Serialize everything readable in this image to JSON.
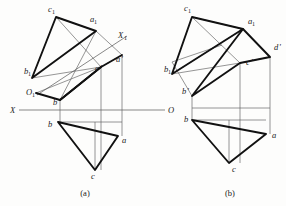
{
  "figure": {
    "captions": [
      {
        "id": "caption-a",
        "text": "(a)"
      },
      {
        "id": "caption-b",
        "text": "(b)"
      }
    ],
    "axes": [
      {
        "name": "X",
        "label": "X"
      },
      {
        "name": "O",
        "label": "O"
      },
      {
        "name": "X1",
        "label": "X",
        "subscript": "1"
      },
      {
        "name": "O1",
        "label": "O",
        "subscript": "1"
      }
    ]
  },
  "diagram_a": {
    "caption": "(a)",
    "labels": [
      {
        "key": "c1",
        "text": "c",
        "subscript": "1",
        "prime": "",
        "x": 48,
        "y": 12
      },
      {
        "key": "a1",
        "text": "a",
        "subscript": "1",
        "prime": "",
        "x": 90,
        "y": 22
      },
      {
        "key": "x1_axis",
        "text": "X",
        "subscript": "1",
        "prime": "",
        "x": 118,
        "y": 38
      },
      {
        "key": "b1",
        "text": "b",
        "subscript": "1",
        "prime": "",
        "x": 24,
        "y": 74
      },
      {
        "key": "o1_axis",
        "text": "O",
        "subscript": "1",
        "prime": "",
        "x": 26,
        "y": 95
      },
      {
        "key": "a_prime",
        "text": "a",
        "subscript": "",
        "prime": "'",
        "x": 116,
        "y": 62
      },
      {
        "key": "c_prime",
        "text": "c",
        "subscript": "",
        "prime": "'",
        "x": 95,
        "y": 71
      },
      {
        "key": "b_prime",
        "text": "b",
        "subscript": "",
        "prime": "'",
        "x": 53,
        "y": 105
      },
      {
        "key": "x_axis",
        "text": "X",
        "subscript": "",
        "prime": "",
        "x": 10,
        "y": 113
      },
      {
        "key": "o_axis",
        "text": "O",
        "subscript": "",
        "prime": "",
        "x": 168,
        "y": 113
      },
      {
        "key": "b",
        "text": "b",
        "subscript": "",
        "prime": "",
        "x": 48,
        "y": 127
      },
      {
        "key": "a",
        "text": "a",
        "subscript": "",
        "prime": "",
        "x": 122,
        "y": 143
      },
      {
        "key": "c",
        "text": "c",
        "subscript": "",
        "prime": "",
        "x": 91,
        "y": 179
      }
    ],
    "points": {
      "c1": [
        56,
        17
      ],
      "a1": [
        96,
        31
      ],
      "b1": [
        32,
        78
      ],
      "a_prime": [
        122,
        55
      ],
      "c_prime": [
        101,
        67
      ],
      "b_prime": [
        60,
        100
      ],
      "o1": [
        36,
        93
      ],
      "b": [
        58,
        122
      ],
      "a": [
        118,
        136
      ],
      "c": [
        95,
        170
      ]
    }
  },
  "diagram_b": {
    "caption": "(b)",
    "labels": [
      {
        "key": "c1",
        "text": "c",
        "subscript": "1",
        "prime": "",
        "x": 184,
        "y": 11
      },
      {
        "key": "a1",
        "text": "a",
        "subscript": "1",
        "prime": "",
        "x": 248,
        "y": 24
      },
      {
        "key": "d_prime",
        "text": "d",
        "subscript": "",
        "prime": "'",
        "x": 274,
        "y": 50
      },
      {
        "key": "c_prime",
        "text": "c",
        "subscript": "",
        "prime": "'",
        "x": 246,
        "y": 65
      },
      {
        "key": "b1",
        "text": "b",
        "subscript": "1",
        "prime": "",
        "x": 164,
        "y": 72
      },
      {
        "key": "b_prime",
        "text": "b",
        "subscript": "",
        "prime": "'",
        "x": 186,
        "y": 94
      },
      {
        "key": "b",
        "text": "b",
        "subscript": "",
        "prime": "",
        "x": 184,
        "y": 122
      },
      {
        "key": "a",
        "text": "a",
        "subscript": "",
        "prime": "",
        "x": 272,
        "y": 138
      },
      {
        "key": "c",
        "text": "c",
        "subscript": "",
        "prime": "",
        "x": 232,
        "y": 170
      }
    ],
    "points": {
      "c1": [
        192,
        17
      ],
      "a1": [
        243,
        29
      ],
      "d_prime": [
        270,
        57
      ],
      "c_prime": [
        240,
        63
      ],
      "b1": [
        172,
        74
      ],
      "b_prime": [
        192,
        96
      ],
      "b": [
        192,
        120
      ],
      "a": [
        266,
        134
      ],
      "c": [
        229,
        163
      ]
    }
  }
}
